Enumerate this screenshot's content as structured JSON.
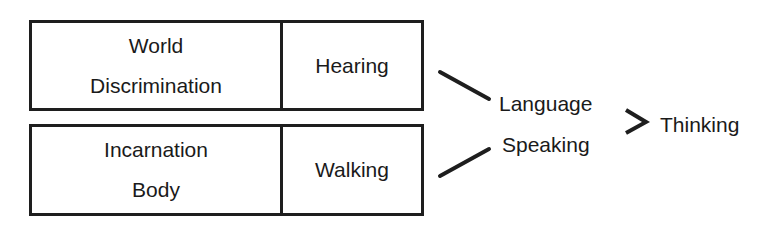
{
  "diagram": {
    "top_box": {
      "left_lines": [
        "World",
        "Discrimination"
      ],
      "right": "Hearing"
    },
    "bottom_box": {
      "left_lines": [
        "Incarnation",
        "Body"
      ],
      "right": "Walking"
    },
    "middle": {
      "upper": "Language",
      "lower": "Speaking"
    },
    "result": "Thinking",
    "connectors": [
      "line",
      "line",
      "greater-than-arrow"
    ]
  }
}
